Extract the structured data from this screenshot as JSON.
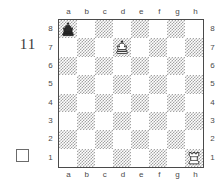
{
  "diagram": {
    "number": "11",
    "side_to_move_marker": "white-empty-square",
    "side_to_move": "white"
  },
  "board": {
    "files": [
      "a",
      "b",
      "c",
      "d",
      "e",
      "f",
      "g",
      "h"
    ],
    "ranks": [
      "8",
      "7",
      "6",
      "5",
      "4",
      "3",
      "2",
      "1"
    ],
    "light_color": "#ffffff",
    "dark_color": "#a3a3a3",
    "border_color": "#4a4a4a",
    "orientation": "white-bottom",
    "pieces": [
      {
        "square": "a8",
        "piece": "black-king",
        "glyph": "♚",
        "color": "black"
      },
      {
        "square": "d7",
        "piece": "white-king",
        "glyph": "♔",
        "color": "white"
      },
      {
        "square": "h1",
        "piece": "white-rook",
        "glyph": "♖",
        "color": "white"
      }
    ],
    "squares": [
      [
        "a8",
        "b8",
        "c8",
        "d8",
        "e8",
        "f8",
        "g8",
        "h8"
      ],
      [
        "a7",
        "b7",
        "c7",
        "d7",
        "e7",
        "f7",
        "g7",
        "h7"
      ],
      [
        "a6",
        "b6",
        "c6",
        "d6",
        "e6",
        "f6",
        "g6",
        "h6"
      ],
      [
        "a5",
        "b5",
        "c5",
        "d5",
        "e5",
        "f5",
        "g5",
        "h5"
      ],
      [
        "a4",
        "b4",
        "c4",
        "d4",
        "e4",
        "f4",
        "g4",
        "h4"
      ],
      [
        "a3",
        "b3",
        "c3",
        "d3",
        "e3",
        "f3",
        "g3",
        "h3"
      ],
      [
        "a2",
        "b2",
        "c2",
        "d2",
        "e2",
        "f2",
        "g2",
        "h2"
      ],
      [
        "a1",
        "b1",
        "c1",
        "d1",
        "e1",
        "f1",
        "g1",
        "h1"
      ]
    ]
  }
}
